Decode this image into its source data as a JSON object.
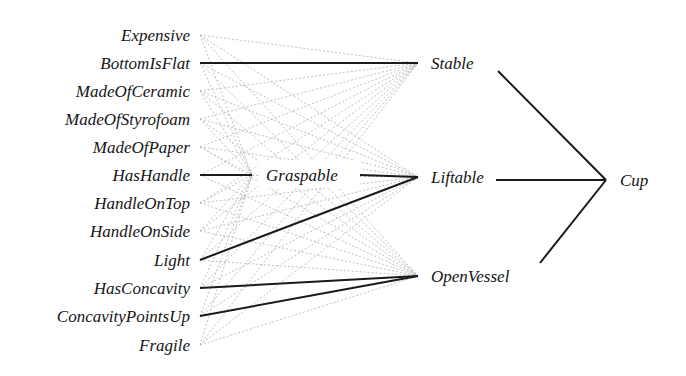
{
  "diagram": {
    "type": "explanation-network",
    "inputs": [
      {
        "id": "Expensive",
        "label": "Expensive",
        "y": 35
      },
      {
        "id": "BottomIsFlat",
        "label": "BottomIsFlat",
        "y": 63
      },
      {
        "id": "MadeOfCeramic",
        "label": "MadeOfCeramic",
        "y": 91
      },
      {
        "id": "MadeOfStyrofoam",
        "label": "MadeOfStyrofoam",
        "y": 119
      },
      {
        "id": "MadeOfPaper",
        "label": "MadeOfPaper",
        "y": 147
      },
      {
        "id": "HasHandle",
        "label": "HasHandle",
        "y": 175
      },
      {
        "id": "HandleOnTop",
        "label": "HandleOnTop",
        "y": 203
      },
      {
        "id": "HandleOnSide",
        "label": "HandleOnSide",
        "y": 231
      },
      {
        "id": "Light",
        "label": "Light",
        "y": 260
      },
      {
        "id": "HasConcavity",
        "label": "HasConcavity",
        "y": 288
      },
      {
        "id": "ConcavityPointsUp",
        "label": "ConcavityPointsUp",
        "y": 316
      },
      {
        "id": "Fragile",
        "label": "Fragile",
        "y": 345
      }
    ],
    "hidden1": [
      {
        "id": "Graspable",
        "label": "Graspable",
        "x": 265,
        "y": 175
      }
    ],
    "hidden2": [
      {
        "id": "Stable",
        "label": "Stable",
        "y": 63
      },
      {
        "id": "Liftable",
        "label": "Liftable",
        "y": 177
      },
      {
        "id": "OpenVessel",
        "label": "OpenVessel",
        "y": 276
      }
    ],
    "output": {
      "id": "Cup",
      "label": "Cup",
      "x": 618,
      "y": 180
    },
    "strong_edges": [
      [
        "BottomIsFlat",
        "Stable"
      ],
      [
        "HasHandle",
        "Graspable"
      ],
      [
        "Graspable",
        "Liftable"
      ],
      [
        "Light",
        "Liftable"
      ],
      [
        "HasConcavity",
        "OpenVessel"
      ],
      [
        "ConcavityPointsUp",
        "OpenVessel"
      ],
      [
        "Stable",
        "Cup"
      ],
      [
        "Liftable",
        "Cup"
      ],
      [
        "OpenVessel",
        "Cup"
      ]
    ],
    "weak_edges_note": "all inputs connect weakly (gray dashed) to Graspable, Stable, Liftable, OpenVessel",
    "colors": {
      "strong": "#1a1a1a",
      "weak": "#b9b9b9",
      "text": "#151515"
    }
  }
}
